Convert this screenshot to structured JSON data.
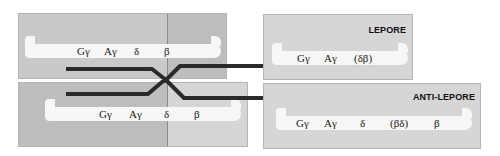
{
  "diagram": {
    "type": "unequal-crossover",
    "parental_top": {
      "genes": [
        "Gγ",
        "Aγ",
        "δ",
        "β"
      ]
    },
    "parental_bottom": {
      "genes": [
        "Gγ",
        "Aγ",
        "δ",
        "β"
      ]
    },
    "product_top": {
      "label": "LEPORE",
      "genes": [
        "Gγ",
        "Aγ",
        "(δβ)"
      ]
    },
    "product_bottom": {
      "label": "ANTI-LEPORE",
      "genes": [
        "Gγ",
        "Aγ",
        "δ",
        "(βδ)",
        "β"
      ]
    },
    "colors": {
      "box_light": "#d6d6d6",
      "box_dark": "#bdbdbd",
      "ribbon": "#f7f7f7",
      "strand": "#2a2a2a"
    }
  }
}
